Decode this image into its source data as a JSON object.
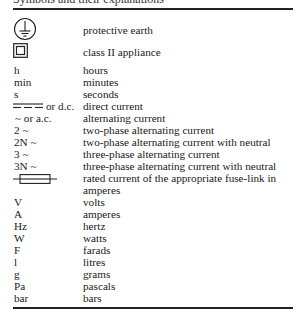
{
  "header": {
    "clipped_text": "Symbols and their explanations"
  },
  "entries": [
    {
      "symbol": "",
      "icon": "protective-earth-icon",
      "meaning": "protective earth"
    },
    {
      "symbol": "",
      "icon": "class-ii-appliance-icon",
      "meaning": "class II appliance"
    },
    {
      "symbol": "h",
      "meaning": "hours"
    },
    {
      "symbol": "min",
      "meaning": "minutes"
    },
    {
      "symbol": "s",
      "meaning": "seconds"
    },
    {
      "symbol": "or d.c.",
      "icon": "direct-current-icon",
      "meaning": "direct current"
    },
    {
      "symbol": "~ or a.c.",
      "meaning": "alternating current"
    },
    {
      "symbol": "2 ~",
      "meaning": "two-phase alternating current"
    },
    {
      "symbol": "2N ~",
      "meaning": "two-phase alternating current with neutral"
    },
    {
      "symbol": "3 ~",
      "meaning": "three-phase alternating current"
    },
    {
      "symbol": "3N ~",
      "meaning": "three-phase alternating current with neutral"
    },
    {
      "symbol": "",
      "icon": "fuse-link-icon",
      "meaning": "rated current of the appropriate fuse-link in",
      "meaning_cont": "amperes"
    },
    {
      "symbol": "V",
      "meaning": "volts"
    },
    {
      "symbol": "A",
      "meaning": "amperes"
    },
    {
      "symbol": "Hz",
      "meaning": "hertz"
    },
    {
      "symbol": "W",
      "meaning": "watts"
    },
    {
      "symbol": "F",
      "meaning": "farads"
    },
    {
      "symbol": "l",
      "meaning": "litres"
    },
    {
      "symbol": "g",
      "meaning": "grams"
    },
    {
      "symbol": "Pa",
      "meaning": "pascals"
    },
    {
      "symbol": "bar",
      "meaning": "bars"
    }
  ]
}
